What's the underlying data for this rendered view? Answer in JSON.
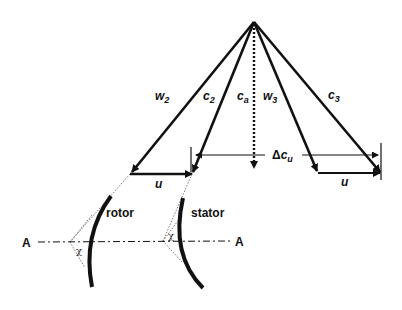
{
  "diagram": {
    "type": "turbomachine velocity triangles",
    "labels": {
      "w2": {
        "main": "w",
        "sub": "2"
      },
      "c2": {
        "main": "c",
        "sub": "2"
      },
      "ca": {
        "main": "c",
        "sub": "a"
      },
      "w3": {
        "main": "w",
        "sub": "3"
      },
      "c3": {
        "main": "c",
        "sub": "3"
      },
      "delta_cu": {
        "prefix": "Δ",
        "main": "c",
        "sub": "u"
      },
      "u_left": "u",
      "u_right": "u",
      "rotor": "rotor",
      "stator": "stator",
      "axis_left": "A",
      "axis_right": "A",
      "chi_rotor": "χ",
      "chi_stator": "χ"
    },
    "colors": {
      "stroke": "#111111",
      "background": "#ffffff",
      "thin": "#555555"
    }
  }
}
